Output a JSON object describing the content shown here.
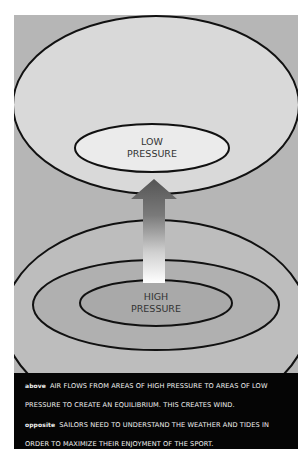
{
  "diagram": {
    "low_label": [
      "LOW",
      "PRESSURE"
    ],
    "high_label": [
      "HIGH",
      "PRESSURE"
    ],
    "colors": {
      "background": "#b6b6b6",
      "low_outer": "#d9d9d9",
      "low_inner": "#ebebeb",
      "high_outer": "#bdbdbd",
      "high_middle": "#b0b0b0",
      "high_inner": "#a9a9a9",
      "stroke": "#111111",
      "arrow_top": "#555555",
      "arrow_bottom": "#ffffff"
    }
  },
  "caption": {
    "lines": [
      {
        "key": "above",
        "text": "AIR FLOWS FROM AREAS OF HIGH PRESSURE TO AREAS OF LOW"
      },
      {
        "key": "",
        "text": "PRESSURE TO CREATE AN EQUILIBRIUM. THIS CREATES WIND."
      },
      {
        "key": "opposite",
        "text": "SAILORS NEED TO UNDERSTAND THE WEATHER AND TIDES IN"
      },
      {
        "key": "",
        "text": "ORDER TO MAXIMIZE THEIR ENJOYMENT OF THE SPORT."
      }
    ]
  }
}
